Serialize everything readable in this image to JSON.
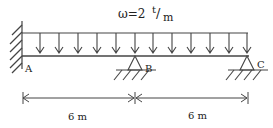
{
  "diagram": {
    "type": "continuous beam",
    "load": {
      "symbol": "ω=2",
      "unit_num": "t",
      "unit_slash": "/",
      "unit_den": "m",
      "type": "uniformly distributed load",
      "arrow_count": 12
    },
    "supports": [
      {
        "label": "A",
        "type": "fixed"
      },
      {
        "label": "B",
        "type": "pin"
      },
      {
        "label": "C",
        "type": "pin"
      }
    ],
    "dimensions": [
      {
        "label": "6 m",
        "from": "A",
        "to": "B"
      },
      {
        "label": "6 m",
        "from": "B",
        "to": "C"
      }
    ],
    "colors": {
      "line": "#444444",
      "text": "#222222",
      "background": "#ffffff"
    }
  }
}
